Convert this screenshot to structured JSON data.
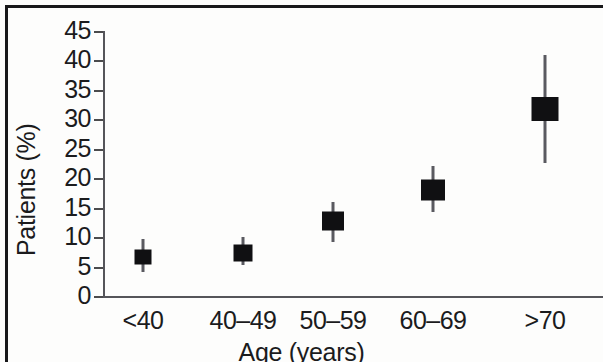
{
  "chart_data": {
    "type": "scatter",
    "title": "",
    "xlabel": "Age (years)",
    "ylabel": "Patients (%)",
    "categories": [
      "<40",
      "40–49",
      "50–59",
      "60–69",
      ">70"
    ],
    "values": [
      6.6,
      7.3,
      12.7,
      18.0,
      31.8
    ],
    "error_low": [
      4.0,
      5.2,
      9.2,
      14.2,
      22.5
    ],
    "error_high": [
      9.6,
      10.0,
      16.0,
      22.0,
      41.0
    ],
    "ylim": [
      0,
      45
    ],
    "yticks": [
      0,
      5,
      10,
      15,
      20,
      25,
      30,
      35,
      40,
      45
    ],
    "ytick_labels": [
      "0",
      "5",
      "10",
      "15",
      "20",
      "25",
      "30",
      "35",
      "40",
      "45"
    ],
    "grid": false,
    "legend": null,
    "marker": "filled-square",
    "marker_color": "#101012",
    "errorbar_color": "#5a5a60",
    "axis_color": "#55555a"
  }
}
